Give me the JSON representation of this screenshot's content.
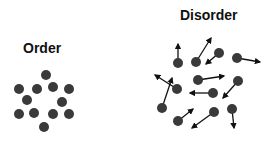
{
  "order": {
    "title": "Order",
    "dots": [
      [
        46,
        75
      ],
      [
        19,
        89
      ],
      [
        37,
        89
      ],
      [
        53,
        87
      ],
      [
        69,
        89
      ],
      [
        27,
        100
      ],
      [
        62,
        102
      ],
      [
        19,
        114
      ],
      [
        34,
        113
      ],
      [
        53,
        114
      ],
      [
        69,
        114
      ],
      [
        44,
        127
      ]
    ]
  },
  "disorder": {
    "title": "Disorder",
    "particles": [
      {
        "dot": [
          178,
          63
        ],
        "arrow": [
          178,
          44
        ]
      },
      {
        "dot": [
          196,
          62
        ],
        "arrow": [
          211,
          38
        ]
      },
      {
        "dot": [
          219,
          53
        ],
        "arrow": [
          206,
          64
        ]
      },
      {
        "dot": [
          237,
          58
        ],
        "arrow": [
          260,
          62
        ]
      },
      {
        "dot": [
          198,
          80
        ],
        "arrow": [
          224,
          76
        ]
      },
      {
        "dot": [
          238,
          81
        ],
        "arrow": [
          223,
          98
        ]
      },
      {
        "dot": [
          177,
          89
        ],
        "arrow": [
          155,
          75
        ]
      },
      {
        "dot": [
          213,
          93
        ],
        "arrow": [
          190,
          93
        ]
      },
      {
        "dot": [
          162,
          108
        ],
        "arrow": [
          172,
          78
        ]
      },
      {
        "dot": [
          178,
          121
        ],
        "arrow": [
          193,
          109
        ]
      },
      {
        "dot": [
          214,
          112
        ],
        "arrow": [
          192,
          128
        ]
      },
      {
        "dot": [
          232,
          109
        ],
        "arrow": [
          234,
          128
        ]
      }
    ]
  },
  "colors": {
    "dot": "#3a3a3a",
    "arrow": "#111111",
    "text": "#111111"
  }
}
